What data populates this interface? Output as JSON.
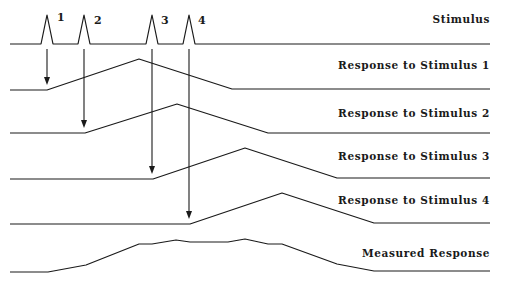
{
  "diagram": {
    "traces": [
      {
        "id": "stimulus",
        "label": "Stimulus",
        "label_pos": [
          490,
          23
        ],
        "points": [
          [
            10,
            44
          ],
          [
            41,
            44
          ],
          [
            47,
            15
          ],
          [
            53,
            44
          ],
          [
            78,
            44
          ],
          [
            84,
            15
          ],
          [
            90,
            44
          ],
          [
            146,
            44
          ],
          [
            152,
            15
          ],
          [
            158,
            44
          ],
          [
            183,
            44
          ],
          [
            189,
            15
          ],
          [
            195,
            44
          ],
          [
            490,
            44
          ]
        ]
      },
      {
        "id": "response-1",
        "label": "Response to Stimulus 1",
        "label_pos": [
          490,
          69
        ],
        "points": [
          [
            10,
            90
          ],
          [
            47,
            90
          ],
          [
            139,
            59
          ],
          [
            232,
            89
          ],
          [
            490,
            89
          ]
        ]
      },
      {
        "id": "response-2",
        "label": "Response to Stimulus 2",
        "label_pos": [
          490,
          117
        ],
        "points": [
          [
            10,
            133
          ],
          [
            85,
            133
          ],
          [
            177,
            104
          ],
          [
            268,
            133
          ],
          [
            490,
            133
          ]
        ]
      },
      {
        "id": "response-3",
        "label": "Response to Stimulus 3",
        "label_pos": [
          490,
          160
        ],
        "points": [
          [
            10,
            179
          ],
          [
            153,
            179
          ],
          [
            245,
            148
          ],
          [
            337,
            178
          ],
          [
            490,
            178
          ]
        ]
      },
      {
        "id": "response-4",
        "label": "Response to Stimulus 4",
        "label_pos": [
          490,
          204
        ],
        "points": [
          [
            10,
            224
          ],
          [
            190,
            224
          ],
          [
            282,
            193
          ],
          [
            374,
            223
          ],
          [
            490,
            223
          ]
        ]
      },
      {
        "id": "measured-response",
        "label": "Measured Response",
        "label_pos": [
          490,
          257
        ],
        "points": [
          [
            10,
            272
          ],
          [
            48,
            272
          ],
          [
            86,
            265
          ],
          [
            139,
            244
          ],
          [
            152,
            244
          ],
          [
            176,
            240
          ],
          [
            190,
            242
          ],
          [
            228,
            242
          ],
          [
            245,
            239
          ],
          [
            268,
            244
          ],
          [
            282,
            244
          ],
          [
            337,
            264
          ],
          [
            374,
            271
          ],
          [
            490,
            271
          ]
        ]
      }
    ],
    "pulse_labels": [
      {
        "text": "1",
        "x": 57,
        "y": 21
      },
      {
        "text": "2",
        "x": 94,
        "y": 24
      },
      {
        "text": "3",
        "x": 161,
        "y": 24
      },
      {
        "text": "4",
        "x": 198,
        "y": 24
      }
    ],
    "arrows": [
      {
        "from_stimulus": 1,
        "x": 47,
        "y1": 49,
        "y2": 85
      },
      {
        "from_stimulus": 2,
        "x": 84,
        "y1": 49,
        "y2": 128
      },
      {
        "from_stimulus": 3,
        "x": 152,
        "y1": 49,
        "y2": 174
      },
      {
        "from_stimulus": 4,
        "x": 189,
        "y1": 49,
        "y2": 219
      }
    ],
    "colors": {
      "ink": "#1a1a1a",
      "background": "#ffffff"
    }
  }
}
